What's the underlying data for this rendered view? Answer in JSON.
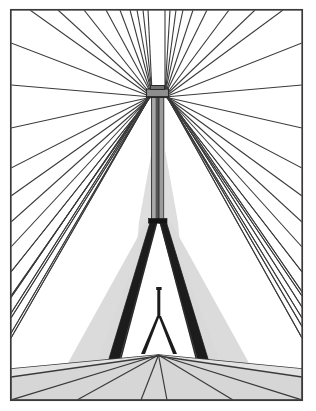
{
  "illustration": {
    "title": "Cable-stayed bridge perspective line drawing",
    "subject": "cable-stayed-bridge",
    "viewpoint": "roadway-level-looking-forward",
    "canvas": {
      "width": 316,
      "height": 411,
      "background": "#ffffff"
    },
    "frame": {
      "label": "image-border",
      "x": 10.5,
      "y": 9.5,
      "width": 292,
      "height": 391,
      "stroke": "#3a3a3a",
      "stroke_width": 1.6,
      "fill": "#ffffff"
    },
    "palette": {
      "line": "#3a3a3a",
      "line_dark": "#1a1a1a",
      "shade_light": "#d9d9d9",
      "shade_mid": "#c7c7c7",
      "deck": "#d6d6d6",
      "white": "#ffffff"
    },
    "geometry": {
      "cable_anchor": {
        "x": 158.5,
        "y": 92
      },
      "vanishing_point": {
        "x": 158.5,
        "y": 355
      },
      "tower_axis_x": 158.5,
      "tower_top_y": 86,
      "tower_split_y": 220,
      "deck_line_y": 372,
      "leg_spread_x": 46,
      "secondary_mast_top_y": 288,
      "secondary_mast_base_y": 352
    },
    "elements": {
      "tower_cap": "tower-cap-block",
      "tower_shaft": "tower-shaft",
      "tower_crossbeam": "tower-crossbeam",
      "tower_leg_left": "tower-leg-left",
      "tower_leg_right": "tower-leg-right",
      "secondary_mast": "secondary-mast",
      "roadway_deck": "roadway-deck",
      "cable_fan_left": "cable-fan-left",
      "cable_fan_right": "cable-fan-right",
      "back_stay_left": "back-stay-left",
      "back_stay_right": "back-stay-right"
    },
    "cables": {
      "count_left": 23,
      "count_right": 23,
      "stroke": "#3a3a3a",
      "stroke_width": 1.1,
      "description": "Stay cables radiate in a fan from the tower head down to the deck and outward past the frame edges."
    },
    "deck": {
      "lane_line_count": 6,
      "fill": "#d6d6d6",
      "stroke": "#3a3a3a",
      "description": "Perspective roadway deck with converging lane markings."
    }
  }
}
